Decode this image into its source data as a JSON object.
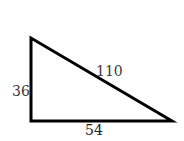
{
  "diagram": {
    "type": "right-triangle",
    "stroke_color": "#000000",
    "sides": {
      "left_vertical": "36",
      "hypotenuse": "110",
      "bottom_horizontal": "54"
    }
  }
}
